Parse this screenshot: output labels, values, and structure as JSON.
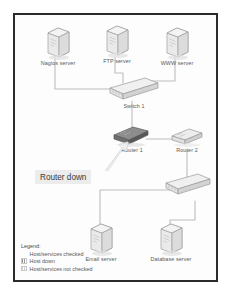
{
  "diagram": {
    "nodes": [
      {
        "id": "nagios",
        "label": "Nagios server",
        "type": "server",
        "state": "checked"
      },
      {
        "id": "ftp",
        "label": "FTP server",
        "type": "server",
        "state": "checked"
      },
      {
        "id": "www",
        "label": "WWW server",
        "type": "server",
        "state": "checked"
      },
      {
        "id": "switch1",
        "label": "Switch 1",
        "type": "switch",
        "state": "checked"
      },
      {
        "id": "router1",
        "label": "Router 1",
        "type": "router",
        "state": "down"
      },
      {
        "id": "router2",
        "label": "Router 2",
        "type": "router",
        "state": "not-checked"
      },
      {
        "id": "switch2",
        "label": "",
        "type": "switch",
        "state": "not-checked"
      },
      {
        "id": "email",
        "label": "Email server",
        "type": "server",
        "state": "not-checked"
      },
      {
        "id": "database",
        "label": "Database server",
        "type": "server",
        "state": "not-checked"
      }
    ],
    "callout": {
      "text": "Router down",
      "points_to": "router1"
    }
  },
  "legend": {
    "title": "Legend:",
    "items": [
      {
        "label": "Host/services checked",
        "swatch": "#ffffff"
      },
      {
        "label": "Host down",
        "swatch": "#9a9a9a"
      },
      {
        "label": "Host/services not checked",
        "swatch": "#d2d2d2"
      }
    ]
  },
  "colors": {
    "frame": "#2b2b2b",
    "wire": "#b9b9b9",
    "device_light": "#e3e3e3",
    "device_dark": "#6e6e6e",
    "callout_bg": "#ececec",
    "label_text": "#585858"
  }
}
